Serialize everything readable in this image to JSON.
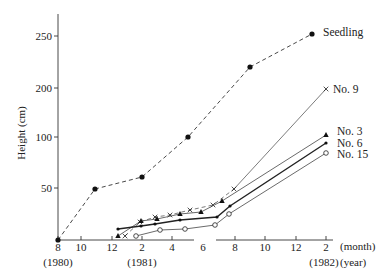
{
  "chart_data": {
    "type": "line",
    "title": "",
    "xlabel": "(month)",
    "xlabel2": "(year)",
    "ylabel": "Height (cm)",
    "y_ticks": [
      {
        "label": "250",
        "value": 250,
        "py": 36
      },
      {
        "label": "200",
        "value": 200,
        "py": 88
      },
      {
        "label": "100",
        "value": 100,
        "py": 137
      },
      {
        "label": "50",
        "value": 50,
        "py": 188
      }
    ],
    "x_ticks": [
      {
        "label": "8",
        "year": "(1980)",
        "px": 58
      },
      {
        "label": "10",
        "year": "",
        "px": 81
      },
      {
        "label": "12",
        "year": "",
        "px": 112
      },
      {
        "label": "2",
        "year": "(1981)",
        "px": 142
      },
      {
        "label": "4",
        "year": "",
        "px": 172
      },
      {
        "label": "6",
        "year": "",
        "px": 203
      },
      {
        "label": "8",
        "year": "",
        "px": 235
      },
      {
        "label": "10",
        "year": "",
        "px": 265
      },
      {
        "label": "12",
        "year": "",
        "px": 296
      },
      {
        "label": "2",
        "year": "(1982)",
        "px": 326
      }
    ],
    "x_categories": [
      "Aug 1980",
      "Oct 1980",
      "Dec 1980",
      "Feb 1981",
      "Apr 1981",
      "Jun 1981",
      "Aug 1981",
      "Oct 1981",
      "Dec 1981",
      "Feb 1982"
    ],
    "axis_note": "Y axis is non-linear (50, 100, 200, 250 roughly equally spaced in upper region)",
    "grid": false,
    "legend_position": "inline labels at right end of lines",
    "series": [
      {
        "name": "Seedling",
        "style": "dashed",
        "marker": "filled-circle",
        "points": [
          {
            "x": "Aug 1980",
            "y": 0,
            "px": 58,
            "py": 240
          },
          {
            "x": "Nov 1980",
            "y": 50,
            "px": 95,
            "py": 189
          },
          {
            "x": "Feb 1981",
            "y": 60,
            "px": 142,
            "py": 177
          },
          {
            "x": "May 1981",
            "y": 100,
            "px": 188,
            "py": 137
          },
          {
            "x": "Sep 1981",
            "y": 220,
            "px": 250,
            "py": 67
          },
          {
            "x": "Jan 1982",
            "y": 250,
            "px": 312,
            "py": 34
          }
        ],
        "label_px": 323,
        "label_py": 36
      },
      {
        "name": "No. 9",
        "style": "thin-solid-then-dashed",
        "marker": "x",
        "points": [
          {
            "px": 125,
            "py": 236
          },
          {
            "px": 140,
            "py": 222
          },
          {
            "px": 155,
            "py": 217
          },
          {
            "px": 170,
            "py": 215
          },
          {
            "px": 190,
            "py": 210
          },
          {
            "px": 213,
            "py": 205
          },
          {
            "px": 234,
            "py": 189
          },
          {
            "px": 326,
            "py": 89
          }
        ],
        "end_value": 195,
        "label_px": 333,
        "label_py": 93
      },
      {
        "name": "No. 3",
        "style": "solid",
        "marker": "filled-triangle",
        "points": [
          {
            "px": 118,
            "py": 236
          },
          {
            "px": 141,
            "py": 221
          },
          {
            "px": 157,
            "py": 219
          },
          {
            "px": 180,
            "py": 214
          },
          {
            "px": 201,
            "py": 212
          },
          {
            "px": 222,
            "py": 201
          },
          {
            "px": 326,
            "py": 135
          }
        ],
        "end_value": 100,
        "label_px": 337,
        "label_py": 135
      },
      {
        "name": "No. 6",
        "style": "thick-solid",
        "marker": "small-filled-circle",
        "points": [
          {
            "px": 118,
            "py": 229
          },
          {
            "px": 141,
            "py": 226
          },
          {
            "px": 155,
            "py": 224
          },
          {
            "px": 180,
            "py": 220
          },
          {
            "px": 217,
            "py": 217
          },
          {
            "px": 230,
            "py": 206
          },
          {
            "px": 326,
            "py": 143
          }
        ],
        "end_value": 90,
        "label_px": 337,
        "label_py": 147
      },
      {
        "name": "No. 15",
        "style": "thin-solid",
        "marker": "open-circle",
        "points": [
          {
            "px": 136,
            "py": 236
          },
          {
            "px": 160,
            "py": 230
          },
          {
            "px": 185,
            "py": 229
          },
          {
            "px": 215,
            "py": 225
          },
          {
            "px": 229,
            "py": 214
          },
          {
            "px": 326,
            "py": 153
          }
        ],
        "end_value": 80,
        "label_px": 337,
        "label_py": 158
      }
    ]
  }
}
